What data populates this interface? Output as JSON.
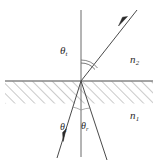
{
  "figure": {
    "kind": "optics-refraction-reflection-diagram",
    "background_color": "#ffffff",
    "stroke_color": "#4a4a4a",
    "hatch_color": "#8a8a8a",
    "label_color": "#2b2b2b",
    "width": 158,
    "height": 163
  },
  "media": {
    "upper_label": "n",
    "upper_subscript": "2",
    "lower_label": "n",
    "lower_subscript": "1"
  },
  "angles": {
    "transmitted": {
      "symbol": "θ",
      "subscript": "t"
    },
    "incident": {
      "symbol": "θ",
      "subscript": "i"
    },
    "reflected": {
      "symbol": "θ",
      "subscript": "r"
    }
  },
  "geometry": {
    "interface_y": 81,
    "normal_x": 81,
    "normal_top_y": 10,
    "normal_bottom_y": 157,
    "hatch_top_y": 81,
    "hatch_bottom_y": 103,
    "origin_x": 81,
    "origin_y": 81,
    "refracted_ray_end_x": 137,
    "refracted_ray_end_y": 10,
    "incident_ray_start_x": 57,
    "incident_ray_start_y": 158,
    "reflected_ray_end_x": 107,
    "reflected_ray_end_y": 160
  },
  "elements": {
    "interface_line_name": "interface-line",
    "normal_line_name": "normal-line",
    "hatched_region_name": "hatched-substrate-region",
    "refracted_ray_name": "refracted-ray",
    "incident_ray_name": "incident-ray",
    "reflected_ray_name": "reflected-ray",
    "angle_arc_name": "transmitted-angle-arc"
  }
}
